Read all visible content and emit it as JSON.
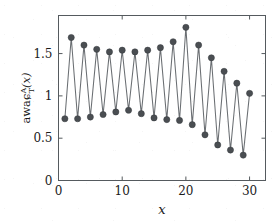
{
  "figure": {
    "background_color": "#ffffff",
    "frame_color": "#555a5e",
    "line_color": "#6a6e72",
    "marker_color": "#4a4e52"
  },
  "axes": {
    "x_title": "x",
    "y_title_main": "awaɕ",
    "y_title_sup": "A",
    "y_title_sub": "T",
    "y_title_arg": "(x)",
    "x_ticks": [
      "0",
      "10",
      "20",
      "30"
    ],
    "y_ticks": [
      "0",
      "0.5",
      "1",
      "1.5"
    ]
  },
  "chart_data": {
    "type": "line",
    "title": "",
    "xlabel": "x",
    "ylabel": "awaɕ^A_T(x)",
    "xlim": [
      0,
      32.5
    ],
    "ylim": [
      0,
      1.95
    ],
    "grid": false,
    "legend": "none",
    "marker": "circle",
    "x": [
      1,
      2,
      3,
      4,
      5,
      6,
      7,
      8,
      9,
      10,
      11,
      12,
      13,
      14,
      15,
      16,
      17,
      18,
      19,
      20,
      21,
      22,
      23,
      24,
      25,
      26,
      27,
      28,
      29,
      30
    ],
    "y": [
      0.73,
      1.69,
      0.73,
      1.6,
      0.75,
      1.55,
      0.78,
      1.52,
      0.81,
      1.54,
      0.83,
      1.52,
      0.79,
      1.54,
      0.74,
      1.57,
      0.72,
      1.64,
      0.71,
      1.81,
      0.66,
      1.6,
      0.54,
      1.45,
      0.42,
      1.29,
      0.36,
      1.15,
      0.3,
      1.03
    ],
    "x_ticks": [
      0,
      10,
      20,
      30
    ],
    "y_ticks": [
      0,
      0.5,
      1,
      1.5
    ]
  }
}
